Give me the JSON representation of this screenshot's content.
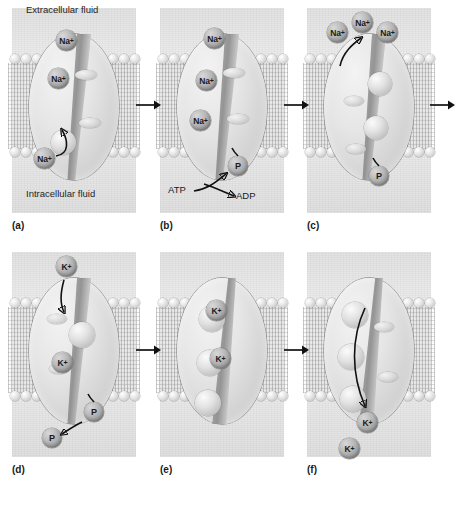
{
  "figure": {
    "labels": {
      "extracellular": "Extracellular fluid",
      "intracellular": "Intracellular fluid"
    },
    "energy": {
      "atp": "ATP",
      "adp": "ADP"
    },
    "ion_names": {
      "sodium": "Na",
      "potassium": "K",
      "phosphate": "P",
      "charge": "+"
    },
    "caption": ""
  },
  "panels": [
    {
      "id": "a",
      "letter": "(a)",
      "description": "Three sodium ions bind to the pump from the intracellular fluid",
      "ions": [
        {
          "label": "Na",
          "charge": "+",
          "x": 44,
          "y": 22,
          "size": 21,
          "name": "sodium-ion-bound-1"
        },
        {
          "label": "Na",
          "charge": "+",
          "x": 36,
          "y": 60,
          "size": 21,
          "name": "sodium-ion-bound-2"
        },
        {
          "label": "Na",
          "charge": "+",
          "x": 22,
          "y": 140,
          "size": 21,
          "name": "sodium-ion-free"
        }
      ]
    },
    {
      "id": "b",
      "letter": "(b)",
      "description": "ATP is hydrolyzed to ADP and the phosphate group attaches to the pump",
      "ions": [
        {
          "label": "Na",
          "charge": "+",
          "x": 44,
          "y": 20,
          "size": 21,
          "name": "sodium-ion-bound-1"
        },
        {
          "label": "Na",
          "charge": "+",
          "x": 36,
          "y": 62,
          "size": 21,
          "name": "sodium-ion-bound-2"
        },
        {
          "label": "Na",
          "charge": "+",
          "x": 30,
          "y": 102,
          "size": 21,
          "name": "sodium-ion-bound-3"
        },
        {
          "label": "P",
          "charge": "",
          "x": 68,
          "y": 148,
          "size": 20,
          "name": "phosphate-group"
        }
      ]
    },
    {
      "id": "c",
      "letter": "(c)",
      "description": "The pump changes shape and releases three sodium ions outside the cell",
      "ions": [
        {
          "label": "Na",
          "charge": "+",
          "x": 20,
          "y": 14,
          "size": 21,
          "name": "sodium-ion-released-1"
        },
        {
          "label": "Na",
          "charge": "+",
          "x": 45,
          "y": 4,
          "size": 21,
          "name": "sodium-ion-released-2"
        },
        {
          "label": "Na",
          "charge": "+",
          "x": 70,
          "y": 14,
          "size": 21,
          "name": "sodium-ion-released-3"
        },
        {
          "label": "P",
          "charge": "",
          "x": 62,
          "y": 158,
          "size": 20,
          "name": "phosphate-group"
        }
      ]
    },
    {
      "id": "d",
      "letter": "(d)",
      "description": "Two potassium ions bind and the phosphate group is released",
      "ions": [
        {
          "label": "K",
          "charge": "+",
          "x": 44,
          "y": 4,
          "size": 21,
          "name": "potassium-ion-free"
        },
        {
          "label": "K",
          "charge": "+",
          "x": 40,
          "y": 100,
          "size": 21,
          "name": "potassium-ion-bound"
        },
        {
          "label": "P",
          "charge": "",
          "x": 72,
          "y": 150,
          "size": 20,
          "name": "phosphate-attached"
        },
        {
          "label": "P",
          "charge": "",
          "x": 30,
          "y": 176,
          "size": 20,
          "name": "phosphate-released"
        }
      ]
    },
    {
      "id": "e",
      "letter": "(e)",
      "description": "Two potassium ions are bound to the pump with no phosphate attached",
      "ions": [
        {
          "label": "K",
          "charge": "+",
          "x": 46,
          "y": 48,
          "size": 21,
          "name": "potassium-ion-bound-1"
        },
        {
          "label": "K",
          "charge": "+",
          "x": 50,
          "y": 96,
          "size": 21,
          "name": "potassium-ion-bound-2"
        }
      ]
    },
    {
      "id": "f",
      "letter": "(f)",
      "description": "The pump returns to its original shape releasing potassium ions inside the cell",
      "ions": [
        {
          "label": "K",
          "charge": "+",
          "x": 50,
          "y": 160,
          "size": 21,
          "name": "potassium-ion-released-1"
        },
        {
          "label": "K",
          "charge": "+",
          "x": 32,
          "y": 186,
          "size": 21,
          "name": "potassium-ion-released-2"
        }
      ]
    }
  ],
  "connectors": [
    {
      "name": "arrow-a-to-b",
      "x": 136,
      "y": 99
    },
    {
      "name": "arrow-b-to-c",
      "x": 284,
      "y": 99
    },
    {
      "name": "arrow-c-to-d",
      "x": 430,
      "y": 99
    },
    {
      "name": "arrow-d-to-e",
      "x": 136,
      "y": 344
    },
    {
      "name": "arrow-e-to-f",
      "x": 284,
      "y": 344
    }
  ]
}
